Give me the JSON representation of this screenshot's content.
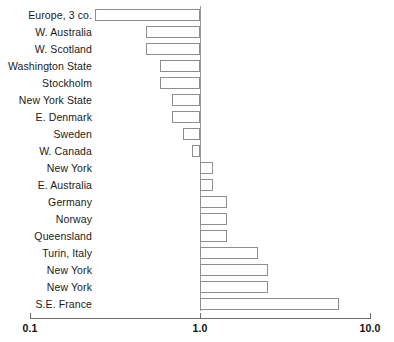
{
  "chart_data": {
    "type": "bar",
    "orientation": "horizontal",
    "scale": "log",
    "title": "",
    "subtitle": "",
    "xlabel": "",
    "ylabel": "",
    "xlim": [
      0.1,
      10.0
    ],
    "xticks": [
      0.1,
      1.0,
      10.0
    ],
    "xtick_labels": [
      "0.1",
      "1.0",
      "10.0"
    ],
    "grid": false,
    "legend": null,
    "reference_line": 1.0,
    "bar_fill": "#ffffff",
    "bar_edge": "#8e8e8e",
    "axis_color": "#6d6d6d",
    "text_color": "#1a1a1a",
    "categories": [
      "Europe, 3 co.",
      "W. Australia",
      "W. Scotland",
      "Washington State",
      "Stockholm",
      "New York State",
      "E. Denmark",
      "Sweden",
      "W. Canada",
      "New York",
      "E. Australia",
      "Germany",
      "Norway",
      "Queensland",
      "Turin, Italy",
      "New York",
      "New York",
      "S.E. France"
    ],
    "values": [
      0.24,
      0.48,
      0.48,
      0.58,
      0.58,
      0.68,
      0.68,
      0.79,
      0.9,
      1.2,
      1.2,
      1.45,
      1.45,
      1.45,
      2.2,
      2.5,
      2.5,
      6.6
    ]
  }
}
